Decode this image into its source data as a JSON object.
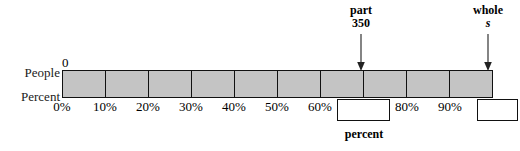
{
  "diagram": {
    "title_alt": "Percent bar model: part 350 of whole s",
    "row_labels": {
      "people": "People",
      "percent": "Percent"
    },
    "zero_label": "0",
    "bar": {
      "segment_count": 10,
      "fill_color": "#c4c4c4",
      "stroke_color": "#111111"
    },
    "ticks": [
      {
        "label": "0%",
        "percent": 0
      },
      {
        "label": "10%",
        "percent": 10
      },
      {
        "label": "20%",
        "percent": 20
      },
      {
        "label": "30%",
        "percent": 30
      },
      {
        "label": "40%",
        "percent": 40
      },
      {
        "label": "50%",
        "percent": 50
      },
      {
        "label": "60%",
        "percent": 60
      },
      {
        "label": "80%",
        "percent": 80
      },
      {
        "label": "90%",
        "percent": 90
      }
    ],
    "answer_boxes": [
      {
        "name": "percent-box",
        "value": "",
        "caption": "percent",
        "percent": 70
      },
      {
        "name": "whole-box",
        "value": "",
        "caption": "",
        "percent": 100
      }
    ],
    "callouts": [
      {
        "title": "part",
        "value": "350",
        "italic": false,
        "percent": 70
      },
      {
        "title": "whole",
        "value": "s",
        "italic": true,
        "percent": 100
      }
    ],
    "caption_percent": "percent"
  }
}
